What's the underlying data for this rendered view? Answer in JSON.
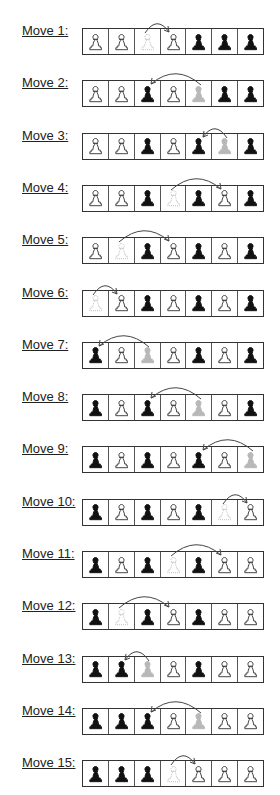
{
  "legend": {
    "W": "white pawn (outline)",
    "B": "black pawn (filled)",
    "w": "white pawn moved from here (faded)",
    "b": "black pawn moved from here (faded)"
  },
  "colors": {
    "white_pawn_stroke": "#333333",
    "black_pawn_fill": "#111111",
    "faded": "#b8b8b8",
    "arrow": "#444444"
  },
  "moves": [
    {
      "label": "Move 1:",
      "cells": [
        "W",
        "W",
        "w",
        "W",
        "B",
        "B",
        "B"
      ],
      "from": 2,
      "to": 3
    },
    {
      "label": "Move 2:",
      "cells": [
        "W",
        "W",
        "B",
        "W",
        "b",
        "B",
        "B"
      ],
      "from": 4,
      "to": 2
    },
    {
      "label": "Move 3:",
      "cells": [
        "W",
        "W",
        "B",
        "W",
        "B",
        "b",
        "B"
      ],
      "from": 5,
      "to": 4
    },
    {
      "label": "Move 4:",
      "cells": [
        "W",
        "W",
        "B",
        "w",
        "B",
        "W",
        "B"
      ],
      "from": 3,
      "to": 5
    },
    {
      "label": "Move 5:",
      "cells": [
        "W",
        "w",
        "B",
        "W",
        "B",
        "W",
        "B"
      ],
      "from": 1,
      "to": 3
    },
    {
      "label": "Move 6:",
      "cells": [
        "w",
        "W",
        "B",
        "W",
        "B",
        "W",
        "B"
      ],
      "from": 0,
      "to": 1
    },
    {
      "label": "Move 7:",
      "cells": [
        "B",
        "W",
        "b",
        "W",
        "B",
        "W",
        "B"
      ],
      "from": 2,
      "to": 0
    },
    {
      "label": "Move 8:",
      "cells": [
        "B",
        "W",
        "B",
        "W",
        "b",
        "W",
        "B"
      ],
      "from": 4,
      "to": 2
    },
    {
      "label": "Move 9:",
      "cells": [
        "B",
        "W",
        "B",
        "W",
        "B",
        "W",
        "b"
      ],
      "from": 6,
      "to": 4
    },
    {
      "label": "Move 10:",
      "cells": [
        "B",
        "W",
        "B",
        "W",
        "B",
        "w",
        "W"
      ],
      "from": 5,
      "to": 6
    },
    {
      "label": "Move 11:",
      "cells": [
        "B",
        "W",
        "B",
        "w",
        "B",
        "W",
        "W"
      ],
      "from": 3,
      "to": 5
    },
    {
      "label": "Move 12:",
      "cells": [
        "B",
        "w",
        "B",
        "W",
        "B",
        "W",
        "W"
      ],
      "from": 1,
      "to": 3
    },
    {
      "label": "Move 13:",
      "cells": [
        "B",
        "B",
        "b",
        "W",
        "B",
        "W",
        "W"
      ],
      "from": 2,
      "to": 1
    },
    {
      "label": "Move 14:",
      "cells": [
        "B",
        "B",
        "B",
        "W",
        "b",
        "W",
        "W"
      ],
      "from": 4,
      "to": 2
    },
    {
      "label": "Move 15:",
      "cells": [
        "B",
        "B",
        "B",
        "w",
        "W",
        "W",
        "W"
      ],
      "from": 3,
      "to": 4
    }
  ]
}
